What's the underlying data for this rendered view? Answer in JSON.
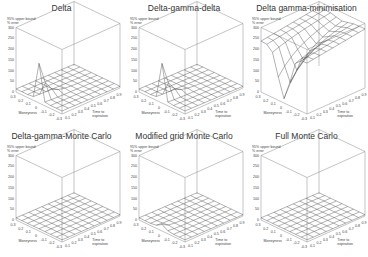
{
  "chart_data": [
    {
      "type": "surface",
      "title": "Delta",
      "zlabel": "95% upper bound % error",
      "xlabel": "Moneyness",
      "ylabel": "Time to expiration",
      "zticks": [
        0,
        50,
        100,
        150,
        200,
        250,
        300
      ],
      "xticks": [
        0.3,
        0.2,
        0.1,
        0,
        -0.1,
        -0.2,
        -0.3
      ],
      "yticks": [
        0.1,
        0.2,
        0.3,
        0.4,
        0.5,
        0.6,
        0.7,
        0.8,
        0.9,
        1.0
      ],
      "zlim": [
        0,
        300
      ],
      "shape": "sharp spike near moneyness 0 at short expiry, reaching ~180; flat ~10-20 elsewhere"
    },
    {
      "type": "surface",
      "title": "Delta-gamma-delta",
      "zlabel": "95% upper bound % error",
      "xlabel": "Moneyness",
      "ylabel": "Time to expiration",
      "zticks": [
        0,
        50,
        100,
        150,
        200,
        250,
        300
      ],
      "xticks": [
        0.3,
        0.2,
        0.1,
        0,
        -0.1,
        -0.2,
        -0.3
      ],
      "yticks": [
        0.1,
        0.2,
        0.3,
        0.4,
        0.5,
        0.6,
        0.7,
        0.8,
        0.9,
        1.0
      ],
      "zlim": [
        0,
        300
      ],
      "shape": "sharp spike near moneyness 0 at short expiry, reaching ~170; flat ~10-20 elsewhere"
    },
    {
      "type": "surface",
      "title": "Delta gamma-minimisation",
      "zlabel": "95% upper bound % error",
      "xlabel": "Moneyness",
      "ylabel": "Time to expiration",
      "zticks": [
        0,
        50,
        100,
        150,
        200,
        250,
        300
      ],
      "xticks": [
        0.3,
        0.2,
        0.1,
        0,
        -0.1,
        -0.2,
        -0.3
      ],
      "yticks": [
        0.1,
        0.2,
        0.3,
        0.4,
        0.5,
        0.6,
        0.7,
        0.8,
        0.9,
        1.0
      ],
      "zlim": [
        0,
        300
      ],
      "shape": "high plateau ~250-300 across most of grid with a deep valley near moneyness 0 at short expiry"
    },
    {
      "type": "surface",
      "title": "Delta-gamma-Monte Carlo",
      "zlabel": "95% upper bound % error",
      "xlabel": "Moneyness",
      "ylabel": "Time to expiration",
      "zticks": [
        0,
        50,
        100,
        150,
        200,
        250,
        300
      ],
      "xticks": [
        0.3,
        0.2,
        0.1,
        0,
        -0.1,
        -0.2,
        -0.3
      ],
      "yticks": [
        0.1,
        0.2,
        0.3,
        0.4,
        0.5,
        0.6,
        0.7,
        0.8,
        0.9,
        1.0
      ],
      "zlim": [
        0,
        300
      ],
      "shape": "nearly flat ~5-15 across grid"
    },
    {
      "type": "surface",
      "title": "Modified grid Monte Carlo",
      "zlabel": "95% upper bound % error",
      "xlabel": "Moneyness",
      "ylabel": "Time to expiration",
      "zticks": [
        0,
        50,
        100,
        150,
        200,
        250,
        300
      ],
      "xticks": [
        0.3,
        0.2,
        0.1,
        0,
        -0.1,
        -0.2,
        -0.3
      ],
      "yticks": [
        0.1,
        0.2,
        0.3,
        0.4,
        0.5,
        0.6,
        0.7,
        0.8,
        0.9,
        1.0
      ],
      "zlim": [
        0,
        300
      ],
      "shape": "nearly flat ~5-15 with small bump at short expiry"
    },
    {
      "type": "surface",
      "title": "Full Monte Carlo",
      "zlabel": "95% upper bound % error",
      "xlabel": "Moneyness",
      "ylabel": "Time to expiration",
      "zticks": [
        0,
        50,
        100,
        150,
        200,
        250,
        300
      ],
      "xticks": [
        0.3,
        0.2,
        0.1,
        0,
        -0.1,
        -0.2,
        -0.3
      ],
      "yticks": [
        0.1,
        0.2,
        0.3,
        0.4,
        0.5,
        0.6,
        0.7,
        0.8,
        0.9,
        1.0
      ],
      "zlim": [
        0,
        300
      ],
      "shape": "nearly flat ~5-10 across grid"
    }
  ],
  "panels": [
    {
      "title": "Delta",
      "surface": "spike"
    },
    {
      "title": "Delta-gamma-delta",
      "surface": "spike"
    },
    {
      "title": "Delta gamma-minimisation",
      "surface": "plateau"
    },
    {
      "title": "Delta-gamma-Monte Carlo",
      "surface": "flat"
    },
    {
      "title": "Modified grid Monte Carlo",
      "surface": "flat-bump"
    },
    {
      "title": "Full Monte Carlo",
      "surface": "flat"
    }
  ],
  "axis": {
    "zlabel_line1": "95% upper bound",
    "zlabel_line2": "% error",
    "xlabel": "Moneyness",
    "ylabel_line1": "Time to",
    "ylabel_line2": "expiration",
    "zticks": [
      "300",
      "250",
      "200",
      "150",
      "100",
      "50",
      "0"
    ],
    "xticks": [
      "0.3",
      "0.2",
      "0.1",
      "0",
      "-0.1",
      "-0.2",
      "-0.3"
    ],
    "yticks": [
      "0.1",
      "0.2",
      "0.3",
      "0.4",
      "0.5",
      "0.6",
      "0.7",
      "0.8",
      "0.9",
      "1.0"
    ]
  },
  "colors": {
    "line": "#555555",
    "text": "#444444",
    "box": "#888888"
  }
}
